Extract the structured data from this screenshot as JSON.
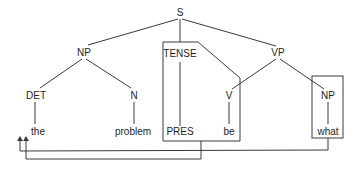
{
  "diagram": {
    "type": "syntax-tree",
    "nodes": {
      "s": "S",
      "np_subject": "NP",
      "tense": "TENSE",
      "vp": "VP",
      "det": "DET",
      "n": "N",
      "v": "V",
      "np_object": "NP"
    },
    "leaves": {
      "the": "the",
      "problem": "problem",
      "pres": "PRES",
      "be": "be",
      "what": "what"
    },
    "boxes": [
      "TENSE-PRES",
      "NP-what"
    ],
    "movements": [
      {
        "from": "PRES",
        "to": "front of 'the'"
      },
      {
        "from": "what",
        "to": "front of 'the'"
      }
    ],
    "colors": {
      "line": "#3a3a3a",
      "text": "#1e1e1e",
      "background": "#ffffff"
    }
  }
}
